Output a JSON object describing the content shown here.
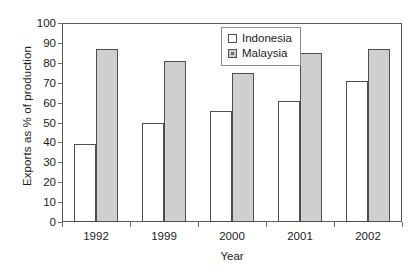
{
  "chart_data": {
    "type": "bar",
    "title": "",
    "xlabel": "Year",
    "ylabel": "Exports as % of production",
    "categories": [
      "1992",
      "1999",
      "2000",
      "2001",
      "2002"
    ],
    "series": [
      {
        "name": "Indonesia",
        "values": [
          39,
          50,
          56,
          61,
          71
        ],
        "color": "#ffffff"
      },
      {
        "name": "Malaysia",
        "values": [
          87,
          81,
          75,
          85,
          87
        ],
        "color": "#cfcfcf"
      }
    ],
    "ylim": [
      0,
      100
    ],
    "ytick_step": 10,
    "yticks": [
      0,
      10,
      20,
      30,
      40,
      50,
      60,
      70,
      80,
      90,
      100
    ],
    "ytick_labels": [
      "0",
      "10",
      "20",
      "30",
      "40",
      "50",
      "60",
      "70",
      "80",
      "90",
      "100"
    ],
    "grid": false,
    "legend_position": "top-center",
    "legend_entries": [
      "Indonesia",
      "Malaysia"
    ],
    "frame": true,
    "border_color": "#595959",
    "bar_border_color": "#4d4d4d"
  },
  "axes": {
    "y_title": "Exports as % of production",
    "x_title": "Year"
  },
  "legend": {
    "items": [
      {
        "label": "Indonesia",
        "swatch": "open-square-swatch"
      },
      {
        "label": "Malaysia",
        "swatch": "filled-square-swatch"
      }
    ]
  }
}
